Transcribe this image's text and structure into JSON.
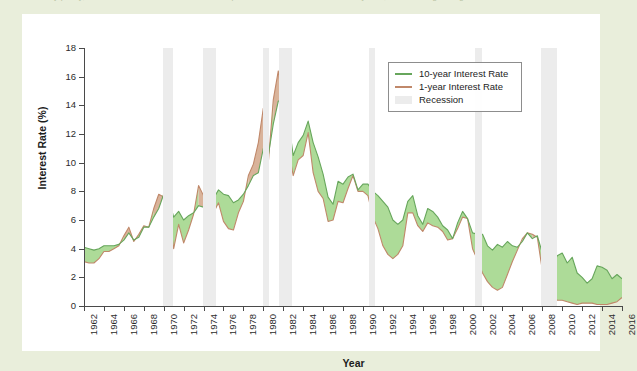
{
  "figure": {
    "caption_clipped": "monetary policy, and business conditions. The bottom panel shows the difference in the yields, with shading during recessions.",
    "colors": {
      "ten_year": "#67a65c",
      "one_year": "#c0886a",
      "recession": "#ececec",
      "fill_positive": "#addb98",
      "fill_negative": "#d9b39a",
      "page_background": "#e9eedb",
      "card_background": "#ffffff",
      "axis": "#4a4a4a"
    }
  },
  "chart_data": {
    "type": "line",
    "title": "",
    "xlabel": "Year",
    "ylabel": "Interest Rate (%)",
    "xlim": [
      1962,
      2016
    ],
    "ylim": [
      0,
      18
    ],
    "yticks": [
      0,
      2,
      4,
      6,
      8,
      10,
      12,
      14,
      16,
      18
    ],
    "xticks": [
      1962,
      1964,
      1966,
      1968,
      1970,
      1972,
      1974,
      1976,
      1978,
      1980,
      1982,
      1984,
      1986,
      1988,
      1990,
      1992,
      1994,
      1996,
      1998,
      2000,
      2002,
      2004,
      2006,
      2008,
      2010,
      2012,
      2014,
      2016
    ],
    "grid": false,
    "legend_position": "upper right",
    "legend": [
      {
        "label": "10-year Interest Rate",
        "marker": "line",
        "color": "#67a65c"
      },
      {
        "label": "1-year Interest Rate",
        "marker": "line",
        "color": "#c0886a"
      },
      {
        "label": "Recession",
        "marker": "band",
        "color": "#ececec"
      }
    ],
    "recessions": [
      {
        "start": 1969.92,
        "end": 1970.92
      },
      {
        "start": 1973.92,
        "end": 1975.25
      },
      {
        "start": 1980.0,
        "end": 1980.58
      },
      {
        "start": 1981.58,
        "end": 1982.92
      },
      {
        "start": 1990.58,
        "end": 1991.25
      },
      {
        "start": 2001.25,
        "end": 2001.92
      },
      {
        "start": 2007.92,
        "end": 2009.5
      }
    ],
    "series": [
      {
        "name": "10-year Interest Rate",
        "color": "#67a65c",
        "x": [
          1962.0,
          1962.5,
          1963.0,
          1963.5,
          1964.0,
          1964.5,
          1965.0,
          1965.5,
          1966.0,
          1966.5,
          1967.0,
          1967.5,
          1968.0,
          1968.5,
          1969.0,
          1969.5,
          1970.0,
          1970.5,
          1971.0,
          1971.5,
          1972.0,
          1972.5,
          1973.0,
          1973.5,
          1974.0,
          1974.5,
          1975.0,
          1975.5,
          1976.0,
          1976.5,
          1977.0,
          1977.5,
          1978.0,
          1978.5,
          1979.0,
          1979.5,
          1980.0,
          1980.5,
          1981.0,
          1981.5,
          1982.0,
          1982.5,
          1983.0,
          1983.5,
          1984.0,
          1984.5,
          1985.0,
          1985.5,
          1986.0,
          1986.5,
          1987.0,
          1987.5,
          1988.0,
          1988.5,
          1989.0,
          1989.5,
          1990.0,
          1990.5,
          1991.0,
          1991.5,
          1992.0,
          1992.5,
          1993.0,
          1993.5,
          1994.0,
          1994.5,
          1995.0,
          1995.5,
          1996.0,
          1996.5,
          1997.0,
          1997.5,
          1998.0,
          1998.5,
          1999.0,
          1999.5,
          2000.0,
          2000.5,
          2001.0,
          2001.5,
          2002.0,
          2002.5,
          2003.0,
          2003.5,
          2004.0,
          2004.5,
          2005.0,
          2005.5,
          2006.0,
          2006.5,
          2007.0,
          2007.5,
          2008.0,
          2008.5,
          2009.0,
          2009.5,
          2010.0,
          2010.5,
          2011.0,
          2011.5,
          2012.0,
          2012.5,
          2013.0,
          2013.5,
          2014.0,
          2014.5,
          2015.0,
          2015.5,
          2016.0
        ],
        "y": [
          4.1,
          4.0,
          3.9,
          4.0,
          4.2,
          4.2,
          4.2,
          4.3,
          4.6,
          5.1,
          4.6,
          4.8,
          5.5,
          5.5,
          6.2,
          6.8,
          7.8,
          7.5,
          6.2,
          6.6,
          6.0,
          6.3,
          6.5,
          7.0,
          6.9,
          7.6,
          7.5,
          8.1,
          7.8,
          7.7,
          7.2,
          7.4,
          7.8,
          8.4,
          9.1,
          9.3,
          11.0,
          10.5,
          12.7,
          14.3,
          14.3,
          13.0,
          10.5,
          11.4,
          11.9,
          12.9,
          11.4,
          10.4,
          9.2,
          7.6,
          7.1,
          8.7,
          8.5,
          9.0,
          9.2,
          8.1,
          8.5,
          8.5,
          8.0,
          7.7,
          7.3,
          6.9,
          6.0,
          5.7,
          6.0,
          7.3,
          7.7,
          6.3,
          5.7,
          6.8,
          6.6,
          6.2,
          5.6,
          5.3,
          4.7,
          5.8,
          6.6,
          6.1,
          5.1,
          5.0,
          5.0,
          4.2,
          3.9,
          4.3,
          4.1,
          4.5,
          4.2,
          4.1,
          4.5,
          5.1,
          4.7,
          4.9,
          3.7,
          3.9,
          2.8,
          3.5,
          3.7,
          3.0,
          3.4,
          2.3,
          2.0,
          1.6,
          1.9,
          2.8,
          2.7,
          2.5,
          1.9,
          2.2,
          1.9
        ]
      },
      {
        "name": "1-year Interest Rate",
        "color": "#c0886a",
        "x": [
          1962.0,
          1962.5,
          1963.0,
          1963.5,
          1964.0,
          1964.5,
          1965.0,
          1965.5,
          1966.0,
          1966.5,
          1967.0,
          1967.5,
          1968.0,
          1968.5,
          1969.0,
          1969.5,
          1970.0,
          1970.5,
          1971.0,
          1971.5,
          1972.0,
          1972.5,
          1973.0,
          1973.5,
          1974.0,
          1974.5,
          1975.0,
          1975.5,
          1976.0,
          1976.5,
          1977.0,
          1977.5,
          1978.0,
          1978.5,
          1979.0,
          1979.5,
          1980.0,
          1980.5,
          1981.0,
          1981.5,
          1982.0,
          1982.5,
          1983.0,
          1983.5,
          1984.0,
          1984.5,
          1985.0,
          1985.5,
          1986.0,
          1986.5,
          1987.0,
          1987.5,
          1988.0,
          1988.5,
          1989.0,
          1989.5,
          1990.0,
          1990.5,
          1991.0,
          1991.5,
          1992.0,
          1992.5,
          1993.0,
          1993.5,
          1994.0,
          1994.5,
          1995.0,
          1995.5,
          1996.0,
          1996.5,
          1997.0,
          1997.5,
          1998.0,
          1998.5,
          1999.0,
          1999.5,
          2000.0,
          2000.5,
          2001.0,
          2001.5,
          2002.0,
          2002.5,
          2003.0,
          2003.5,
          2004.0,
          2004.5,
          2005.0,
          2005.5,
          2006.0,
          2006.5,
          2007.0,
          2007.5,
          2008.0,
          2008.5,
          2009.0,
          2009.5,
          2010.0,
          2010.5,
          2011.0,
          2011.5,
          2012.0,
          2012.5,
          2013.0,
          2013.5,
          2014.0,
          2014.5,
          2015.0,
          2015.5,
          2016.0
        ],
        "y": [
          3.1,
          3.0,
          3.0,
          3.3,
          3.8,
          3.8,
          4.0,
          4.2,
          4.9,
          5.5,
          4.5,
          5.0,
          5.6,
          5.5,
          6.8,
          7.8,
          7.6,
          6.6,
          4.0,
          5.7,
          4.4,
          5.3,
          6.4,
          8.4,
          7.7,
          9.1,
          6.5,
          7.2,
          5.9,
          5.4,
          5.3,
          6.5,
          7.3,
          9.1,
          9.9,
          11.4,
          13.8,
          10.0,
          14.4,
          16.4,
          13.9,
          11.0,
          9.1,
          10.2,
          10.5,
          12.1,
          9.3,
          8.0,
          7.5,
          5.9,
          6.0,
          7.3,
          7.2,
          8.2,
          9.1,
          8.0,
          8.0,
          7.7,
          6.2,
          5.4,
          4.2,
          3.6,
          3.3,
          3.6,
          4.2,
          6.5,
          6.5,
          5.6,
          5.2,
          5.8,
          5.6,
          5.5,
          5.2,
          4.6,
          4.7,
          5.4,
          6.2,
          6.1,
          4.0,
          3.2,
          2.3,
          1.7,
          1.3,
          1.1,
          1.3,
          2.2,
          3.1,
          3.9,
          4.7,
          5.1,
          5.0,
          4.8,
          2.5,
          2.2,
          0.7,
          0.4,
          0.4,
          0.3,
          0.2,
          0.1,
          0.2,
          0.2,
          0.2,
          0.1,
          0.1,
          0.1,
          0.2,
          0.3,
          0.6
        ]
      }
    ]
  }
}
